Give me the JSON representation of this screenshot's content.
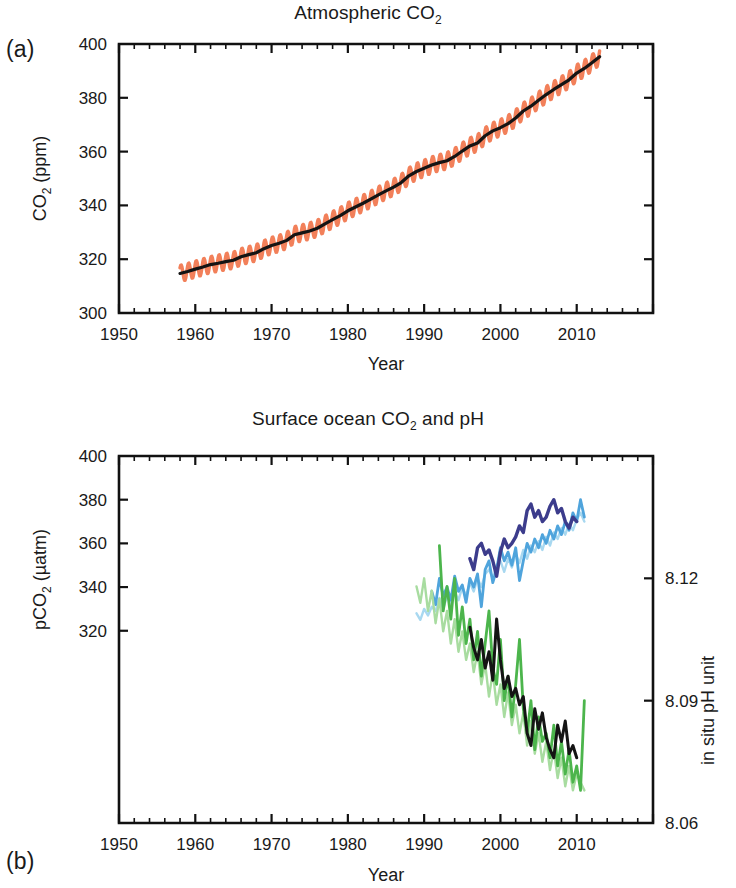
{
  "figure": {
    "panels": [
      {
        "id": "a",
        "letter": "(a)",
        "title_main": "Atmospheric CO",
        "title_sub": "2",
        "ylabel_main": "CO",
        "ylabel_sub": "2",
        "ylabel_tail": " (ppm)",
        "xlabel": "Year",
        "y_ticks": [
          "300",
          "320",
          "340",
          "360",
          "380",
          "400"
        ],
        "x_ticks": [
          "1950",
          "1960",
          "1970",
          "1980",
          "1990",
          "2000",
          "2010"
        ]
      },
      {
        "id": "b",
        "letter": "(b)",
        "title_main": "Surface ocean CO",
        "title_sub": "2",
        "title_tail": " and pH",
        "ylabel_main": "pCO",
        "ylabel_sub": "2",
        "ylabel_tail": " (µatm)",
        "ylabel_right": "in situ pH unit",
        "xlabel": "Year",
        "y_ticks": [
          "320",
          "340",
          "360",
          "380",
          "400"
        ],
        "y_ticks_right": [
          "8.06",
          "8.09",
          "8.12"
        ],
        "x_ticks": [
          "1950",
          "1960",
          "1970",
          "1980",
          "1990",
          "2000",
          "2010"
        ]
      }
    ],
    "colors": {
      "co2_seasonal": "#F2805A",
      "co2_smoothed": "#141414",
      "pco2_dark_blue": "#3C3C8C",
      "pco2_mid_blue": "#4FA4DC",
      "pco2_pale_blue": "#A8D8F0",
      "ph_black": "#141414",
      "ph_mid_green": "#4CB54C",
      "ph_pale_green": "#A8DCA0",
      "axis": "#111111"
    }
  },
  "chart_data": [
    {
      "type": "line",
      "title": "Atmospheric CO2",
      "xlabel": "Year",
      "ylabel": "CO2 (ppm)",
      "xlim": [
        1950,
        2020
      ],
      "ylim": [
        300,
        400
      ],
      "xticks": [
        1950,
        1960,
        1970,
        1980,
        1990,
        2000,
        2010
      ],
      "yticks": [
        300,
        320,
        340,
        360,
        380,
        400
      ],
      "grid": false,
      "legend": "none",
      "series": [
        {
          "name": "Mauna Loa CO2 monthly (seasonal cycle)",
          "color": "#F2805A",
          "note": "orange sawtooth envelope, amplitude ~6 ppm peak-to-peak",
          "x": [
            1958,
            1959,
            1960,
            1961,
            1962,
            1963,
            1964,
            1965,
            1966,
            1967,
            1968,
            1969,
            1970,
            1971,
            1972,
            1973,
            1974,
            1975,
            1976,
            1977,
            1978,
            1979,
            1980,
            1981,
            1982,
            1983,
            1984,
            1985,
            1986,
            1987,
            1988,
            1989,
            1990,
            1991,
            1992,
            1993,
            1994,
            1995,
            1996,
            1997,
            1998,
            1999,
            2000,
            2001,
            2002,
            2003,
            2004,
            2005,
            2006,
            2007,
            2008,
            2009,
            2010,
            2011,
            2012,
            2013
          ],
          "values": [
            315.3,
            316.0,
            316.9,
            317.6,
            318.5,
            319.0,
            319.6,
            320.0,
            321.4,
            322.2,
            323.0,
            324.6,
            325.7,
            326.3,
            327.5,
            329.7,
            330.2,
            331.1,
            332.0,
            333.8,
            335.4,
            336.8,
            338.7,
            340.1,
            341.4,
            343.0,
            344.6,
            346.0,
            347.4,
            349.2,
            351.6,
            353.1,
            354.4,
            355.6,
            356.4,
            357.1,
            358.8,
            360.8,
            362.6,
            363.7,
            366.7,
            368.4,
            369.5,
            371.1,
            373.2,
            375.8,
            377.5,
            379.8,
            381.9,
            383.8,
            385.6,
            387.4,
            389.9,
            391.6,
            393.8,
            396.5
          ]
        },
        {
          "name": "Mauna Loa CO2 annual mean (deseasonalized)",
          "color": "#141414",
          "x": [
            1958,
            1959,
            1960,
            1961,
            1962,
            1963,
            1964,
            1965,
            1966,
            1967,
            1968,
            1969,
            1970,
            1971,
            1972,
            1973,
            1974,
            1975,
            1976,
            1977,
            1978,
            1979,
            1980,
            1981,
            1982,
            1983,
            1984,
            1985,
            1986,
            1987,
            1988,
            1989,
            1990,
            1991,
            1992,
            1993,
            1994,
            1995,
            1996,
            1997,
            1998,
            1999,
            2000,
            2001,
            2002,
            2003,
            2004,
            2005,
            2006,
            2007,
            2008,
            2009,
            2010,
            2011,
            2012,
            2013
          ],
          "values": [
            314.7,
            315.4,
            316.3,
            317.1,
            318.0,
            318.5,
            319.1,
            319.6,
            320.9,
            321.7,
            322.4,
            323.9,
            325.1,
            325.9,
            327.0,
            329.1,
            329.8,
            330.5,
            331.5,
            333.1,
            334.7,
            336.2,
            338.0,
            339.4,
            340.8,
            342.3,
            343.9,
            345.4,
            346.8,
            348.5,
            351.0,
            352.6,
            353.8,
            355.0,
            355.9,
            356.6,
            358.2,
            360.2,
            362.1,
            363.2,
            365.9,
            367.7,
            368.9,
            370.4,
            372.5,
            375.1,
            376.9,
            379.1,
            381.2,
            383.1,
            384.9,
            386.7,
            389.2,
            390.9,
            393.0,
            395.3
          ]
        }
      ]
    },
    {
      "type": "line",
      "title": "Surface ocean CO2 and pH",
      "xlabel": "Year",
      "ylabel_left": "pCO2 (µatm)",
      "ylabel_right": "in situ pH unit",
      "xlim": [
        1950,
        2020
      ],
      "ylim_left": [
        232,
        400
      ],
      "ylim_right": [
        8.06,
        8.15
      ],
      "xticks": [
        1950,
        1960,
        1970,
        1980,
        1990,
        2000,
        2010
      ],
      "yticks_left": [
        320,
        340,
        360,
        380,
        400
      ],
      "yticks_right": [
        8.06,
        8.09,
        8.12
      ],
      "grid": false,
      "legend": "none",
      "series": [
        {
          "name": "pCO2 station dark blue (ALOHA/HOT)",
          "axis": "left",
          "color": "#3C3C8C",
          "x": [
            1996.0,
            1996.5,
            1997.0,
            1997.5,
            1998.0,
            1998.5,
            1999.0,
            1999.5,
            2000.0,
            2000.5,
            2001.0,
            2001.5,
            2002.0,
            2002.5,
            2003.0,
            2003.5,
            2004.0,
            2004.5,
            2005.0,
            2005.5,
            2006.0,
            2006.5,
            2007.0,
            2007.5,
            2008.0,
            2008.5,
            2009.0,
            2009.5,
            2010.0
          ],
          "values": [
            353,
            348,
            358,
            360,
            355,
            357,
            352,
            345,
            356,
            362,
            358,
            360,
            363,
            368,
            365,
            375,
            378,
            372,
            375,
            370,
            372,
            377,
            380,
            374,
            376,
            370,
            367,
            372,
            370
          ]
        },
        {
          "name": "pCO2 station mid blue (BATS)",
          "axis": "left",
          "color": "#4FA4DC",
          "x": [
            1991.0,
            1991.5,
            1992.0,
            1992.5,
            1993.0,
            1993.5,
            1994.0,
            1994.5,
            1995.0,
            1995.5,
            1996.0,
            1996.5,
            1997.0,
            1997.5,
            1998.0,
            1998.5,
            1999.0,
            1999.5,
            2000.0,
            2000.5,
            2001.0,
            2001.5,
            2002.0,
            2002.5,
            2003.0,
            2003.5,
            2004.0,
            2004.5,
            2005.0,
            2005.5,
            2006.0,
            2006.5,
            2007.0,
            2007.5,
            2008.0,
            2008.5,
            2009.0,
            2009.5,
            2010.0,
            2010.5,
            2011.0
          ],
          "values": [
            338,
            332,
            344,
            336,
            340,
            334,
            345,
            338,
            341,
            333,
            344,
            340,
            346,
            331,
            348,
            352,
            342,
            348,
            358,
            352,
            356,
            350,
            358,
            343,
            352,
            360,
            356,
            362,
            358,
            364,
            360,
            366,
            362,
            368,
            364,
            370,
            366,
            374,
            370,
            380,
            372
          ]
        },
        {
          "name": "pCO2 station pale blue (ESTOC)",
          "axis": "left",
          "color": "#A8D8F0",
          "x": [
            1989.0,
            1989.5,
            1990.0,
            1990.5,
            1991.0,
            1991.5,
            1992.0,
            1992.5,
            1993.0,
            1993.5,
            1994.0,
            1994.5,
            1995.0,
            1995.5,
            1996.0,
            1996.5,
            1997.0,
            1997.5,
            1998.0,
            1998.5,
            1999.0,
            1999.5,
            2000.0,
            2000.5,
            2001.0,
            2001.5,
            2002.0,
            2002.5,
            2003.0,
            2003.5,
            2004.0,
            2004.5,
            2005.0,
            2005.5,
            2006.0,
            2006.5,
            2007.0,
            2007.5,
            2008.0,
            2008.5,
            2009.0,
            2009.5,
            2010.0,
            2010.5,
            2011.0
          ],
          "values": [
            328,
            325,
            330,
            327,
            331,
            329,
            335,
            330,
            336,
            332,
            338,
            334,
            340,
            336,
            342,
            338,
            344,
            340,
            346,
            348,
            344,
            350,
            352,
            347,
            353,
            349,
            355,
            351,
            357,
            353,
            359,
            356,
            361,
            357,
            363,
            359,
            365,
            362,
            367,
            364,
            369,
            366,
            371,
            374,
            370
          ]
        },
        {
          "name": "pH station black (ALOHA/HOT)",
          "axis": "right",
          "color": "#141414",
          "x": [
            1996.0,
            1996.5,
            1997.0,
            1997.5,
            1998.0,
            1998.5,
            1999.0,
            1999.5,
            2000.0,
            2000.5,
            2001.0,
            2001.5,
            2002.0,
            2002.5,
            2003.0,
            2003.5,
            2004.0,
            2004.5,
            2005.0,
            2005.5,
            2006.0,
            2006.5,
            2007.0,
            2007.5,
            2008.0,
            2008.5,
            2009.0,
            2009.5,
            2010.0
          ],
          "values": [
            8.108,
            8.103,
            8.1,
            8.105,
            8.098,
            8.102,
            8.095,
            8.11,
            8.1,
            8.093,
            8.096,
            8.091,
            8.093,
            8.089,
            8.091,
            8.082,
            8.079,
            8.088,
            8.083,
            8.087,
            8.081,
            8.078,
            8.076,
            8.084,
            8.08,
            8.085,
            8.077,
            8.079,
            8.076
          ]
        },
        {
          "name": "pH station mid green (BATS)",
          "axis": "right",
          "color": "#4CB54C",
          "x": [
            1992.0,
            1992.5,
            1993.0,
            1993.5,
            1994.0,
            1994.5,
            1995.0,
            1995.5,
            1996.0,
            1996.5,
            1997.0,
            1997.5,
            1998.0,
            1998.5,
            1999.0,
            1999.5,
            2000.0,
            2000.5,
            2001.0,
            2001.5,
            2002.0,
            2002.5,
            2003.0,
            2003.5,
            2004.0,
            2004.5,
            2005.0,
            2005.5,
            2006.0,
            2006.5,
            2007.0,
            2007.5,
            2008.0,
            2008.5,
            2009.0,
            2009.5,
            2010.0,
            2010.5,
            2011.0
          ],
          "values": [
            8.128,
            8.112,
            8.118,
            8.11,
            8.12,
            8.106,
            8.113,
            8.104,
            8.11,
            8.1,
            8.107,
            8.096,
            8.104,
            8.112,
            8.098,
            8.094,
            8.105,
            8.09,
            8.096,
            8.086,
            8.094,
            8.105,
            8.088,
            8.082,
            8.09,
            8.078,
            8.086,
            8.08,
            8.082,
            8.076,
            8.084,
            8.074,
            8.08,
            8.072,
            8.078,
            8.07,
            8.074,
            8.068,
            8.09
          ]
        },
        {
          "name": "pH station pale green (ESTOC)",
          "axis": "right",
          "color": "#A8DCA0",
          "x": [
            1989.0,
            1989.5,
            1990.0,
            1990.5,
            1991.0,
            1991.5,
            1992.0,
            1992.5,
            1993.0,
            1993.5,
            1994.0,
            1994.5,
            1995.0,
            1995.5,
            1996.0,
            1996.5,
            1997.0,
            1997.5,
            1998.0,
            1998.5,
            1999.0,
            1999.5,
            2000.0,
            2000.5,
            2001.0,
            2001.5,
            2002.0,
            2002.5,
            2003.0,
            2003.5,
            2004.0,
            2004.5,
            2005.0,
            2005.5,
            2006.0,
            2006.5,
            2007.0,
            2007.5,
            2008.0,
            2008.5,
            2009.0,
            2009.5,
            2010.0,
            2010.5,
            2011.0
          ],
          "values": [
            8.118,
            8.114,
            8.12,
            8.112,
            8.117,
            8.109,
            8.115,
            8.107,
            8.112,
            8.104,
            8.11,
            8.102,
            8.107,
            8.1,
            8.104,
            8.097,
            8.102,
            8.094,
            8.099,
            8.091,
            8.097,
            8.089,
            8.094,
            8.086,
            8.092,
            8.084,
            8.089,
            8.082,
            8.087,
            8.079,
            8.085,
            8.077,
            8.082,
            8.075,
            8.08,
            8.073,
            8.078,
            8.071,
            8.076,
            8.069,
            8.074,
            8.068,
            8.072,
            8.07,
            8.068
          ]
        }
      ]
    }
  ]
}
